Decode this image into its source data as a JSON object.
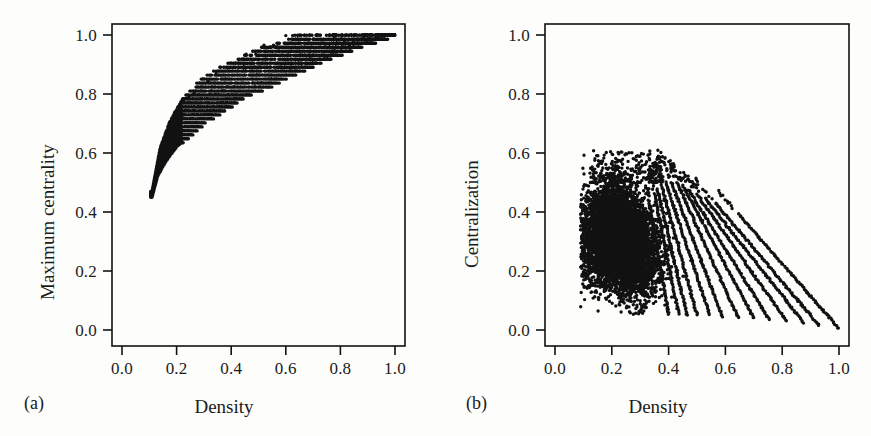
{
  "figure": {
    "width": 871,
    "height": 436,
    "background_color": "#fdfdfb",
    "ink_color": "#111111"
  },
  "chart_data": [
    {
      "type": "scatter",
      "panel_tag": "(a)",
      "title": "",
      "xlabel": "Density",
      "ylabel": "Maximum centrality",
      "xlim": [
        -0.04,
        1.06
      ],
      "ylim": [
        -0.04,
        1.06
      ],
      "xticks": [
        0.0,
        0.2,
        0.4,
        0.6,
        0.8,
        1.0
      ],
      "yticks": [
        0.0,
        0.2,
        0.4,
        0.6,
        0.8,
        1.0
      ],
      "xticklabels": [
        "0.0",
        "0.2",
        "0.4",
        "0.6",
        "0.8",
        "1.0"
      ],
      "yticklabels": [
        "0.0",
        "0.2",
        "0.4",
        "0.6",
        "0.8",
        "1.0"
      ],
      "grid": false,
      "legend": false,
      "marker": "filled-circle",
      "marker_color": "#111111",
      "marker_size_px": 3.0,
      "n_points_approx": 9000,
      "description": "Dense monotonically increasing cloud: maximum centrality rises steeply with density from about (0.11, 0.45) and saturates near 1.0; points fall on discrete horizontal bands (quantized centrality levels) that widen to the right; the upper envelope reaches 1.0 by density 0.65 and the lower envelope climbs from 0.45 to 1.0 at density 1.0.",
      "envelope_lower": [
        [
          0.11,
          0.45
        ],
        [
          0.13,
          0.52
        ],
        [
          0.16,
          0.57
        ],
        [
          0.2,
          0.62
        ],
        [
          0.25,
          0.66
        ],
        [
          0.3,
          0.7
        ],
        [
          0.35,
          0.73
        ],
        [
          0.4,
          0.76
        ],
        [
          0.45,
          0.79
        ],
        [
          0.5,
          0.81
        ],
        [
          0.55,
          0.83
        ],
        [
          0.6,
          0.855
        ],
        [
          0.65,
          0.875
        ],
        [
          0.7,
          0.895
        ],
        [
          0.75,
          0.915
        ],
        [
          0.8,
          0.935
        ],
        [
          0.85,
          0.952
        ],
        [
          0.9,
          0.968
        ],
        [
          0.95,
          0.985
        ],
        [
          1.0,
          1.0
        ]
      ],
      "envelope_upper": [
        [
          0.11,
          0.47
        ],
        [
          0.14,
          0.62
        ],
        [
          0.18,
          0.72
        ],
        [
          0.22,
          0.78
        ],
        [
          0.26,
          0.82
        ],
        [
          0.3,
          0.855
        ],
        [
          0.35,
          0.885
        ],
        [
          0.4,
          0.905
        ],
        [
          0.45,
          0.93
        ],
        [
          0.5,
          0.95
        ],
        [
          0.55,
          0.965
        ],
        [
          0.6,
          0.98
        ],
        [
          0.65,
          1.0
        ],
        [
          0.8,
          1.0
        ],
        [
          1.0,
          1.0
        ]
      ],
      "band_levels": [
        0.735,
        0.755,
        0.775,
        0.8,
        0.825,
        0.85,
        0.875,
        0.905,
        0.935,
        0.965,
        1.0
      ]
    },
    {
      "type": "scatter",
      "panel_tag": "(b)",
      "title": "",
      "xlabel": "Density",
      "ylabel": "Centralization",
      "xlim": [
        -0.04,
        1.06
      ],
      "ylim": [
        -0.04,
        1.06
      ],
      "xticks": [
        0.0,
        0.2,
        0.4,
        0.6,
        0.8,
        1.0
      ],
      "yticks": [
        0.0,
        0.2,
        0.4,
        0.6,
        0.8,
        1.0
      ],
      "xticklabels": [
        "0.0",
        "0.2",
        "0.4",
        "0.6",
        "0.8",
        "1.0"
      ],
      "yticklabels": [
        "0.0",
        "0.2",
        "0.4",
        "0.6",
        "0.8",
        "1.0"
      ],
      "grid": false,
      "legend": false,
      "marker": "filled-circle",
      "marker_color": "#111111",
      "marker_size_px": 3.0,
      "n_points_approx": 9000,
      "description": "Dense blob centred near density 0.22 and centralization 0.32 (spanning roughly 0.09-0.42 in density and 0.10-0.55 in centralization), from which a fan of parallel straight striations descends to the right, each line terminating on the x-axis and all converging toward the point (1.0, 0.0). Maximum centralization observed is about 0.60; scattered outliers sit above the blob near density 0.15-0.35.",
      "blob": {
        "x_center": 0.225,
        "y_center": 0.32,
        "x_range": [
          0.09,
          0.42
        ],
        "y_range": [
          0.08,
          0.56
        ]
      },
      "striations": [
        {
          "x_start": 0.33,
          "y_start": 0.44,
          "x_end": 0.4,
          "y_end": 0.055
        },
        {
          "x_start": 0.35,
          "y_start": 0.46,
          "x_end": 0.435,
          "y_end": 0.055
        },
        {
          "x_start": 0.36,
          "y_start": 0.48,
          "x_end": 0.465,
          "y_end": 0.05
        },
        {
          "x_start": 0.375,
          "y_start": 0.49,
          "x_end": 0.5,
          "y_end": 0.05
        },
        {
          "x_start": 0.39,
          "y_start": 0.5,
          "x_end": 0.545,
          "y_end": 0.05
        },
        {
          "x_start": 0.41,
          "y_start": 0.5,
          "x_end": 0.59,
          "y_end": 0.045
        },
        {
          "x_start": 0.43,
          "y_start": 0.5,
          "x_end": 0.645,
          "y_end": 0.04
        },
        {
          "x_start": 0.45,
          "y_start": 0.49,
          "x_end": 0.7,
          "y_end": 0.04
        },
        {
          "x_start": 0.47,
          "y_start": 0.475,
          "x_end": 0.755,
          "y_end": 0.035
        },
        {
          "x_start": 0.5,
          "y_start": 0.46,
          "x_end": 0.815,
          "y_end": 0.03
        },
        {
          "x_start": 0.53,
          "y_start": 0.445,
          "x_end": 0.875,
          "y_end": 0.025
        },
        {
          "x_start": 0.565,
          "y_start": 0.43,
          "x_end": 0.93,
          "y_end": 0.015
        },
        {
          "x_start": 0.645,
          "y_start": 0.395,
          "x_end": 1.0,
          "y_end": 0.005
        }
      ]
    }
  ]
}
